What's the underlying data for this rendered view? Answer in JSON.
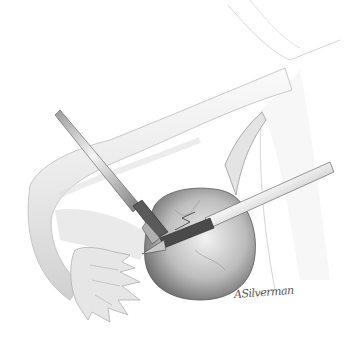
{
  "illustration": {
    "subject": "laparoscopic ovarian cystectomy",
    "elements": [
      "uterine-tube",
      "fimbriae",
      "ovarian-cyst",
      "grasper-left",
      "grasper-right",
      "pelvic-wall"
    ],
    "palette": {
      "background": "#ffffff",
      "tissue_light": "#eeeeee",
      "tissue_mid": "#c8c8c8",
      "tissue_dark": "#6a6a6a",
      "instrument_light": "#e6e6e6",
      "instrument_dark": "#3a3a3a"
    }
  },
  "signature": {
    "text": "ASilverman"
  }
}
